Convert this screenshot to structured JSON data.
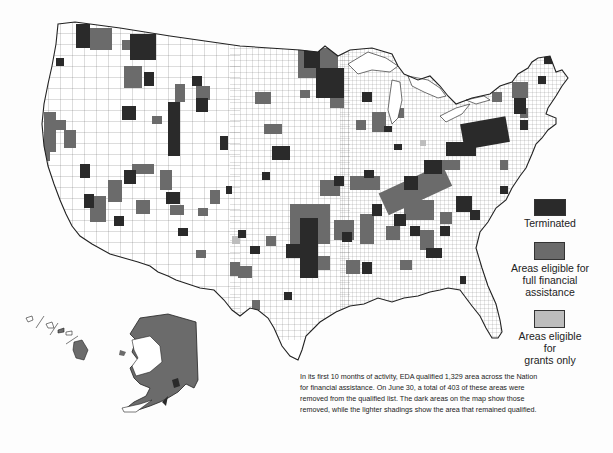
{
  "map": {
    "title": "EDA qualified areas map",
    "colors": {
      "terminated": "#2a2a2a",
      "full_financial": "#6b6b6b",
      "grants_only": "#bdbdbd",
      "not_qualified": "#ffffff",
      "outline": "#333333"
    },
    "insets": [
      "Alaska",
      "Hawaii"
    ]
  },
  "legend": {
    "items": [
      {
        "key": "terminated",
        "label": "Terminated",
        "color": "#2a2a2a"
      },
      {
        "key": "full_financial",
        "label_lines": [
          "Areas eligible for",
          "full financial",
          "assistance"
        ],
        "color": "#6b6b6b"
      },
      {
        "key": "grants_only",
        "label_lines": [
          "Areas eligible",
          "for",
          "grants only"
        ],
        "color": "#bdbdbd"
      }
    ]
  },
  "caption": {
    "text": "In its first 10 months of activity, EDA qualified 1,329 area across the Nation for financial assistance. On June 30, a total of 403 of these areas were removed from the qualified list. The dark areas on the map show those removed, while the lighter shadings show the area that remained qualified.",
    "stats": {
      "months_of_activity": 10,
      "areas_qualified": 1329,
      "areas_removed": 403,
      "date": "June 30"
    }
  }
}
